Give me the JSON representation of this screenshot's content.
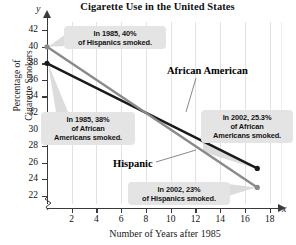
{
  "chart_data": {
    "type": "line",
    "title": "Cigarette Use in the United States",
    "xlabel": "Number of Years after 1985",
    "ylabel_line1": "Percentage of",
    "ylabel_line2": "Cigarette Smokers",
    "axis_letter_x": "x",
    "axis_letter_y": "y",
    "xlim": [
      0,
      19
    ],
    "ylim": [
      21,
      43
    ],
    "xticks": [
      2,
      4,
      6,
      8,
      10,
      12,
      14,
      16,
      18
    ],
    "yticks": [
      22,
      24,
      26,
      28,
      30,
      32,
      34,
      36,
      38,
      40,
      42
    ],
    "grid": "vertical",
    "axis_break": true,
    "legend_position": "inline-labels",
    "series": [
      {
        "name": "African American",
        "color": "#1a1a1a",
        "x": [
          0,
          17
        ],
        "values": [
          38,
          25.3
        ]
      },
      {
        "name": "Hispanic",
        "color": "#8a8a8a",
        "x": [
          0,
          17
        ],
        "values": [
          40,
          23
        ]
      }
    ],
    "annotations": [
      {
        "id": "hispanic-1985",
        "line1": "In 1985, 40%",
        "line2": "of Hispanics smoked.",
        "line3": "",
        "target_x": 0,
        "target_y": 40
      },
      {
        "id": "african-american-1985",
        "line1": "In 1985, 38%",
        "line2": "of African",
        "line3": "Americans smoked.",
        "target_x": 0,
        "target_y": 38
      },
      {
        "id": "african-american-2002",
        "line1": "In 2002, 25.3%",
        "line2": "of African",
        "line3": "Americans smoked.",
        "target_x": 17,
        "target_y": 25.3
      },
      {
        "id": "hispanic-2002",
        "line1": "In 2002, 23%",
        "line2": "of Hispanics smoked.",
        "line3": "",
        "target_x": 17,
        "target_y": 23
      }
    ]
  },
  "colors": {
    "african_american_line": "#1a1a1a",
    "hispanic_line": "#8a8a8a",
    "callout_bg": "#e4e4e4",
    "gridline": "#e2e2e2",
    "axis": "#3a3a3a"
  }
}
